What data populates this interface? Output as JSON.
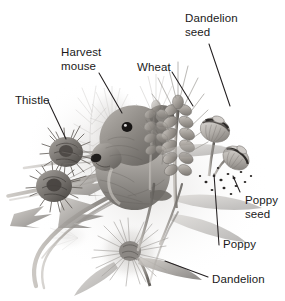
{
  "figure": {
    "background_color": "#ffffff",
    "text_color": "#1a1a1a",
    "leader_line_color": "#231f20",
    "style": "grayscale pencil illustration",
    "width": 285,
    "height": 301
  },
  "labels": [
    {
      "id": "dandelion-seed",
      "text": "Dandelion\nseed",
      "x": 185,
      "y": 12,
      "leader": {
        "x1": 209,
        "y1": 44,
        "x2": 230,
        "y2": 106
      }
    },
    {
      "id": "harvest-mouse",
      "text": "Harvest\nmouse",
      "x": 61,
      "y": 46,
      "leader": {
        "x1": 99,
        "y1": 73,
        "x2": 122,
        "y2": 113
      }
    },
    {
      "id": "wheat",
      "text": "Wheat",
      "x": 137,
      "y": 61,
      "leader": {
        "x1": 172,
        "y1": 72,
        "x2": 193,
        "y2": 106
      }
    },
    {
      "id": "thistle",
      "text": "Thistle",
      "x": 15,
      "y": 94,
      "leader": {
        "x1": 48,
        "y1": 101,
        "x2": 66,
        "y2": 139
      }
    },
    {
      "id": "poppy-seed",
      "text": "Poppy\nseed",
      "x": 245,
      "y": 194,
      "leader": {
        "x1": 240,
        "y1": 192,
        "x2": 233,
        "y2": 176
      }
    },
    {
      "id": "poppy",
      "text": "Poppy",
      "x": 223,
      "y": 238,
      "leader": {
        "x1": 219,
        "y1": 245,
        "x2": 214,
        "y2": 174
      }
    },
    {
      "id": "dandelion",
      "text": "Dandelion",
      "x": 212,
      "y": 273,
      "leader": {
        "x1": 208,
        "y1": 277,
        "x2": 165,
        "y2": 261
      }
    }
  ],
  "subjects": [
    {
      "id": "harvest-mouse",
      "name": "Harvest mouse"
    },
    {
      "id": "wheat",
      "name": "Wheat"
    },
    {
      "id": "thistle",
      "name": "Thistle"
    },
    {
      "id": "poppy",
      "name": "Poppy"
    },
    {
      "id": "poppy-seed",
      "name": "Poppy seed"
    },
    {
      "id": "dandelion",
      "name": "Dandelion"
    },
    {
      "id": "dandelion-seed",
      "name": "Dandelion seed"
    }
  ]
}
